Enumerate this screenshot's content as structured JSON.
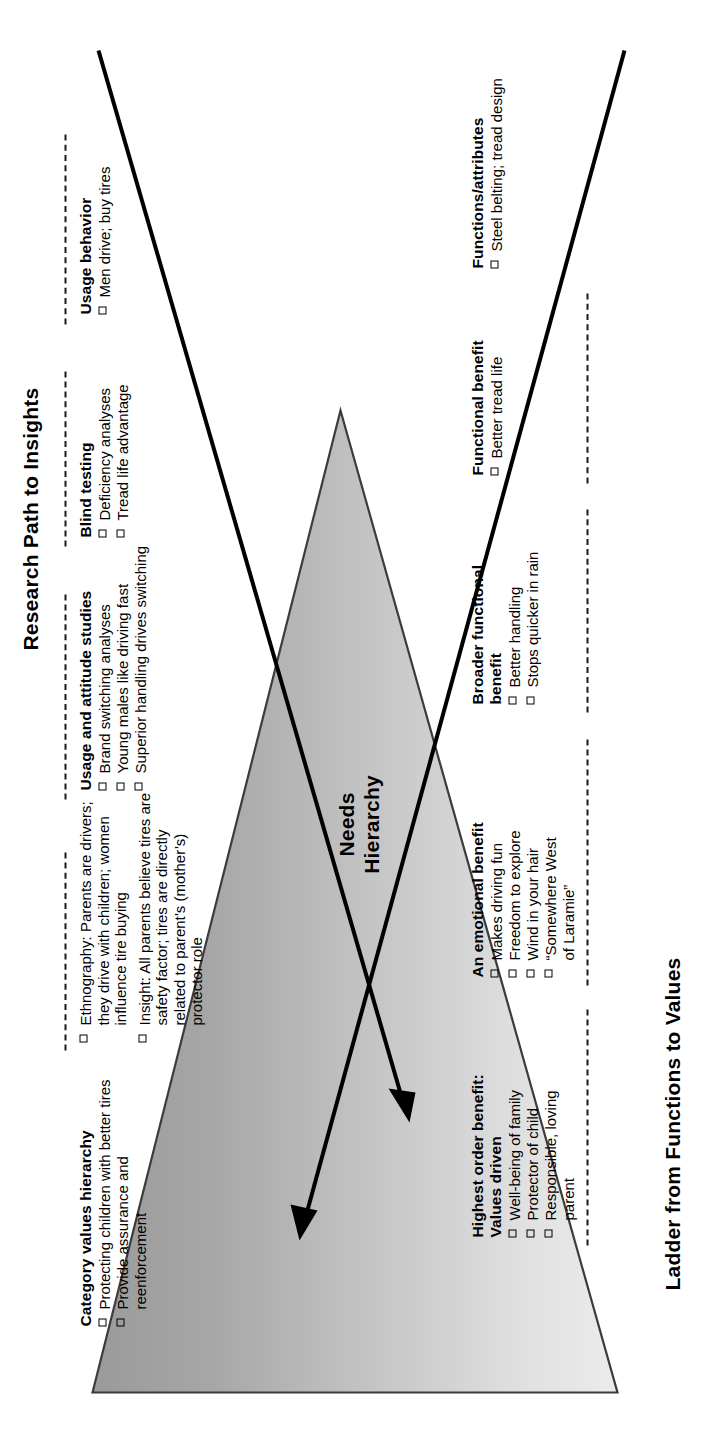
{
  "diagram": {
    "center_label": "Needs\nHierarchy",
    "center_label_line1": "Needs",
    "center_label_line2": "Hierarchy",
    "left_axis_title": "Ladder from Functions to Values",
    "right_axis_title": "Research Path to Insights",
    "checkbox_glyph": "square-outline",
    "colors": {
      "ink": "#000000",
      "triangle_outline": "#3c3c3c",
      "triangle_light": "#e3e3e3",
      "triangle_dark": "#8f8f8f",
      "page_background": "#ffffff"
    }
  },
  "ladder": {
    "title": "Ladder from Functions to Values",
    "arrow_direction": "up",
    "tiers": [
      {
        "id": "highest-order-benefit",
        "title": "Highest order benefit:\nValues driven",
        "title_line1": "Highest order benefit:",
        "title_line2": "Values driven",
        "items": [
          "Well-being of family",
          "Protector of child",
          "Responsible, loving parent"
        ]
      },
      {
        "id": "emotional-benefit",
        "title": "An emotional benefit",
        "items": [
          "Makes driving fun",
          "Freedom to explore",
          "Wind in your hair",
          "“Somewhere West of Laramie”"
        ]
      },
      {
        "id": "broader-functional-benefit",
        "title": "Broader functional benefit",
        "title_line1": "Broader functional",
        "title_line2": "benefit",
        "items": [
          "Better handling",
          "Stops quicker in rain"
        ]
      },
      {
        "id": "functional-benefit",
        "title": "Functional benefit",
        "items": [
          "Better tread life"
        ]
      },
      {
        "id": "functions-attributes",
        "title": "Functions/attributes",
        "items": [
          "Steel belting; tread design"
        ]
      }
    ]
  },
  "research": {
    "title": "Research Path to Insights",
    "arrow_direction": "up",
    "tiers": [
      {
        "id": "category-values-hierarchy",
        "title": "Category values hierarchy",
        "items": [
          "Protecting children with better tires",
          "Provide assurance and reenforcement"
        ]
      },
      {
        "id": "ethnography-insight",
        "title": "",
        "items": [
          "Ethnography: Parents are drivers; they drive with children; women influence tire buying",
          "Insight: All parents believe tires are safety factor; tires are directly related to parent’s (mother’s) protector role"
        ]
      },
      {
        "id": "usage-attitude-studies",
        "title": "Usage and attitude studies",
        "items": [
          "Brand switching analyses",
          "Young males like driving fast",
          "Superior handling drives switching"
        ]
      },
      {
        "id": "blind-testing",
        "title": "Blind testing",
        "items": [
          "Deficiency analyses",
          "Tread life advantage"
        ]
      },
      {
        "id": "usage-behavior",
        "title": "Usage behavior",
        "items": [
          "Men drive; buy tires"
        ]
      }
    ]
  }
}
